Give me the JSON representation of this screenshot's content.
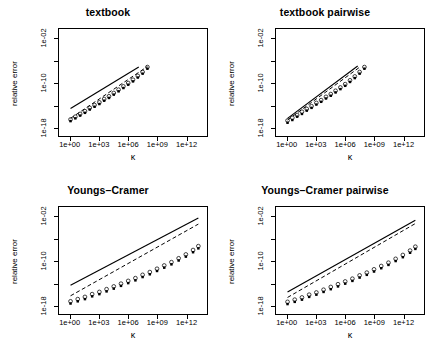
{
  "figure": {
    "background": "#ffffff",
    "foreground": "#000000",
    "layout": "2x2 grid of log-log panels"
  },
  "axis": {
    "xlabel": "κ",
    "ylabel": "relative error",
    "x_tick_labels": [
      "1e+00",
      "1e+03",
      "1e+06",
      "1e+09",
      "1e+12"
    ],
    "y_tick_labels": [
      "1e-02",
      "1e-10",
      "1e-18"
    ]
  },
  "panels": [
    {
      "id": "textbook",
      "title": "textbook",
      "position": "top-left"
    },
    {
      "id": "textbook-pairwise",
      "title": "textbook pairwise",
      "position": "top-right"
    },
    {
      "id": "youngs-cramer",
      "title": "Youngs–Cramer",
      "position": "bottom-left"
    },
    {
      "id": "youngs-cramer-pairwise",
      "title": "Youngs–Cramer pairwise",
      "position": "bottom-right"
    }
  ],
  "chart_data": [
    {
      "type": "scatter",
      "title": "textbook",
      "xlabel": "κ",
      "ylabel": "relative error",
      "xscale": "log10",
      "yscale": "log10",
      "xlim": [
        -1.2,
        14.2
      ],
      "ylim": [
        -19.6,
        -0.2
      ],
      "xticks": [
        0,
        3,
        6,
        9,
        12
      ],
      "xticklabels": [
        "1e+00",
        "1e+03",
        "1e+06",
        "1e+09",
        "1e+12"
      ],
      "yticks": [
        -2,
        -10,
        -18
      ],
      "yticklabels": [
        "1e-02",
        "1e-10",
        "1e-18"
      ],
      "grid": false,
      "legend": "none",
      "series": [
        {
          "name": "open circle",
          "marker": "circle-open",
          "x": [
            0.0,
            0.5,
            1.0,
            1.5,
            2.0,
            2.5,
            3.0,
            3.5,
            4.0,
            4.5,
            5.0,
            5.5,
            6.0,
            6.5,
            7.0,
            7.5,
            8.0
          ],
          "y": [
            -16.6,
            -16.1,
            -15.6,
            -15.1,
            -14.5,
            -14.0,
            -13.5,
            -12.9,
            -12.4,
            -11.8,
            -11.2,
            -10.6,
            -10.0,
            -9.4,
            -8.7,
            -8.0,
            -7.1
          ]
        },
        {
          "name": "filled point",
          "marker": "point-filled",
          "x": [
            0.0,
            0.5,
            1.0,
            1.5,
            2.0,
            2.5,
            3.0,
            3.5,
            4.0,
            4.5,
            5.0,
            5.5,
            6.0,
            6.5,
            7.0,
            7.5,
            8.0
          ],
          "y": [
            -16.9,
            -16.4,
            -15.9,
            -15.4,
            -14.8,
            -14.3,
            -13.8,
            -13.2,
            -12.7,
            -12.1,
            -11.5,
            -10.9,
            -10.3,
            -9.7,
            -9.0,
            -8.3,
            -7.4
          ]
        }
      ],
      "reference_lines": [
        {
          "name": "solid",
          "style": "solid",
          "x": [
            0.0,
            7.1
          ],
          "y": [
            -14.6,
            -7.1
          ]
        },
        {
          "name": "dashed",
          "style": "dashed",
          "x": [
            0.0,
            8.0
          ],
          "y": [
            -16.4,
            -7.0
          ]
        }
      ]
    },
    {
      "type": "scatter",
      "title": "textbook pairwise",
      "xlabel": "κ",
      "ylabel": "relative error",
      "xscale": "log10",
      "yscale": "log10",
      "xlim": [
        -1.2,
        14.2
      ],
      "ylim": [
        -19.6,
        -0.2
      ],
      "xticks": [
        0,
        3,
        6,
        9,
        12
      ],
      "xticklabels": [
        "1e+00",
        "1e+03",
        "1e+06",
        "1e+09",
        "1e+12"
      ],
      "yticks": [
        -2,
        -10,
        -18
      ],
      "yticklabels": [
        "1e-02",
        "1e-10",
        "1e-18"
      ],
      "grid": false,
      "legend": "none",
      "series": [
        {
          "name": "open circle",
          "marker": "circle-open",
          "x": [
            0.0,
            0.5,
            1.0,
            1.5,
            2.0,
            2.5,
            3.0,
            3.5,
            4.0,
            4.5,
            5.0,
            5.5,
            6.0,
            6.5,
            7.0,
            7.5,
            8.0
          ],
          "y": [
            -16.8,
            -16.3,
            -15.8,
            -15.2,
            -14.7,
            -14.2,
            -13.6,
            -13.1,
            -12.5,
            -12.0,
            -11.4,
            -10.8,
            -10.2,
            -9.5,
            -8.8,
            -8.0,
            -7.1
          ]
        },
        {
          "name": "filled point",
          "marker": "point-filled",
          "x": [
            0.0,
            0.5,
            1.0,
            1.5,
            2.0,
            2.5,
            3.0,
            3.5,
            4.0,
            4.5,
            5.0,
            5.5,
            6.0,
            6.5,
            7.0,
            7.5,
            8.0
          ],
          "y": [
            -17.2,
            -16.7,
            -16.1,
            -15.6,
            -15.0,
            -14.5,
            -13.9,
            -13.4,
            -12.8,
            -12.3,
            -11.7,
            -11.1,
            -10.5,
            -9.8,
            -9.1,
            -8.3,
            -7.4
          ]
        }
      ],
      "reference_lines": [
        {
          "name": "solid",
          "style": "solid",
          "x": [
            0.0,
            7.3
          ],
          "y": [
            -16.4,
            -6.9
          ]
        },
        {
          "name": "dashed",
          "style": "dashed",
          "x": [
            0.0,
            7.6
          ],
          "y": [
            -16.7,
            -7.0
          ]
        }
      ]
    },
    {
      "type": "scatter",
      "title": "Youngs–Cramer",
      "xlabel": "κ",
      "ylabel": "relative error",
      "xscale": "log10",
      "yscale": "log10",
      "xlim": [
        -1.2,
        14.2
      ],
      "ylim": [
        -19.6,
        -0.2
      ],
      "xticks": [
        0,
        3,
        6,
        9,
        12
      ],
      "xticklabels": [
        "1e+00",
        "1e+03",
        "1e+06",
        "1e+09",
        "1e+12"
      ],
      "yticks": [
        -2,
        -10,
        -18
      ],
      "yticklabels": [
        "1e-02",
        "1e-10",
        "1e-18"
      ],
      "grid": false,
      "legend": "none",
      "series": [
        {
          "name": "open circle",
          "marker": "circle-open",
          "x": [
            0.0,
            0.75,
            1.5,
            2.25,
            3.0,
            3.75,
            4.5,
            5.25,
            6.0,
            6.75,
            7.5,
            8.25,
            9.0,
            9.75,
            10.5,
            11.25,
            12.0,
            12.75,
            13.3
          ],
          "y": [
            -17.3,
            -16.9,
            -16.5,
            -16.0,
            -15.6,
            -15.1,
            -14.6,
            -14.1,
            -13.6,
            -13.1,
            -12.5,
            -12.0,
            -11.4,
            -10.8,
            -10.2,
            -9.5,
            -8.8,
            -8.0,
            -7.3
          ]
        },
        {
          "name": "filled point",
          "marker": "point-filled",
          "x": [
            0.0,
            0.75,
            1.5,
            2.25,
            3.0,
            3.75,
            4.5,
            5.25,
            6.0,
            6.75,
            7.5,
            8.25,
            9.0,
            9.75,
            10.5,
            11.25,
            12.0,
            12.75,
            13.3
          ],
          "y": [
            -17.7,
            -17.3,
            -16.9,
            -16.4,
            -16.0,
            -15.5,
            -15.0,
            -14.5,
            -14.0,
            -13.5,
            -12.9,
            -12.4,
            -11.8,
            -11.2,
            -10.6,
            -9.9,
            -9.2,
            -8.4,
            -7.7
          ]
        }
      ],
      "reference_lines": [
        {
          "name": "solid",
          "style": "solid",
          "x": [
            0.0,
            13.3
          ],
          "y": [
            -14.4,
            -2.2
          ]
        },
        {
          "name": "dashed",
          "style": "dashed",
          "x": [
            0.0,
            13.3
          ],
          "y": [
            -16.3,
            -3.3
          ]
        }
      ]
    },
    {
      "type": "scatter",
      "title": "Youngs–Cramer pairwise",
      "xlabel": "κ",
      "ylabel": "relative error",
      "xscale": "log10",
      "yscale": "log10",
      "xlim": [
        -1.2,
        14.2
      ],
      "ylim": [
        -19.6,
        -0.2
      ],
      "xticks": [
        0,
        3,
        6,
        9,
        12
      ],
      "xticklabels": [
        "1e+00",
        "1e+03",
        "1e+06",
        "1e+09",
        "1e+12"
      ],
      "yticks": [
        -2,
        -10,
        -18
      ],
      "yticklabels": [
        "1e-02",
        "1e-10",
        "1e-18"
      ],
      "grid": false,
      "legend": "none",
      "series": [
        {
          "name": "open circle",
          "marker": "circle-open",
          "x": [
            0.0,
            0.75,
            1.5,
            2.25,
            3.0,
            3.75,
            4.5,
            5.25,
            6.0,
            6.75,
            7.5,
            8.25,
            9.0,
            9.75,
            10.5,
            11.25,
            12.0,
            12.75,
            13.3
          ],
          "y": [
            -17.4,
            -17.0,
            -16.6,
            -16.1,
            -15.7,
            -15.2,
            -14.7,
            -14.2,
            -13.7,
            -13.2,
            -12.6,
            -12.1,
            -11.5,
            -10.9,
            -10.3,
            -9.6,
            -8.9,
            -8.1,
            -7.4
          ]
        },
        {
          "name": "filled point",
          "marker": "point-filled",
          "x": [
            0.0,
            0.75,
            1.5,
            2.25,
            3.0,
            3.75,
            4.5,
            5.25,
            6.0,
            6.75,
            7.5,
            8.25,
            9.0,
            9.75,
            10.5,
            11.25,
            12.0,
            12.75,
            13.3
          ],
          "y": [
            -17.8,
            -17.4,
            -17.0,
            -16.5,
            -16.1,
            -15.6,
            -15.1,
            -14.6,
            -14.1,
            -13.6,
            -13.0,
            -12.5,
            -11.9,
            -11.3,
            -10.7,
            -10.0,
            -9.3,
            -8.5,
            -7.8
          ]
        }
      ],
      "reference_lines": [
        {
          "name": "solid",
          "style": "solid",
          "x": [
            0.0,
            13.3
          ],
          "y": [
            -15.6,
            -2.6
          ]
        },
        {
          "name": "dashed",
          "style": "dashed",
          "x": [
            0.0,
            13.3
          ],
          "y": [
            -16.6,
            -3.2
          ]
        }
      ]
    }
  ]
}
